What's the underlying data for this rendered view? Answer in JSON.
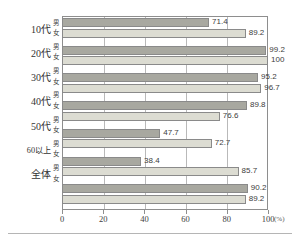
{
  "chart_data": {
    "type": "bar",
    "orientation": "horizontal",
    "title": "",
    "xlabel": "(%)",
    "ylabel": "",
    "xlim": [
      0,
      100
    ],
    "xticks": [
      0,
      20,
      40,
      60,
      80,
      100
    ],
    "grid": true,
    "legend": "none",
    "categories": [
      "10代",
      "20代",
      "30代",
      "40代",
      "50代",
      "60以上",
      "全体"
    ],
    "series": [
      {
        "name": "男",
        "values": [
          71.4,
          99.2,
          95.2,
          89.8,
          47.7,
          38.4,
          90.2
        ],
        "color": "#a8a8a0"
      },
      {
        "name": "女",
        "values": [
          89.2,
          100,
          96.7,
          76.6,
          72.7,
          85.7,
          89.2
        ],
        "color": "#dcdcd2"
      }
    ],
    "value_labels": {
      "10代": {
        "男": "71.4",
        "女": "89.2"
      },
      "20代": {
        "男": "99.2",
        "女": "100"
      },
      "30代": {
        "男": "95.2",
        "女": "96.7"
      },
      "40代": {
        "男": "89.8",
        "女": "76.6"
      },
      "50代": {
        "男": "47.7",
        "女": "72.7"
      },
      "60以上": {
        "男": "38.4",
        "女": "85.7"
      },
      "全体": {
        "男": "90.2",
        "女": "89.2"
      }
    }
  },
  "axis": {
    "unit": "(%)",
    "tick_labels": [
      "0",
      "20",
      "40",
      "60",
      "80",
      "100"
    ]
  },
  "sex_labels": {
    "male": "男",
    "female": "女"
  }
}
